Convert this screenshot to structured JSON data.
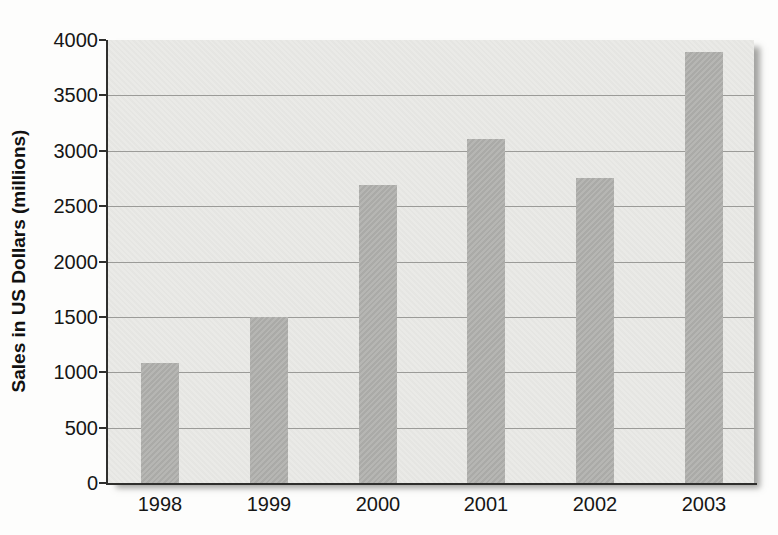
{
  "chart_data": {
    "type": "bar",
    "categories": [
      "1998",
      "1999",
      "2000",
      "2001",
      "2002",
      "2003"
    ],
    "values": [
      1080,
      1500,
      2690,
      3110,
      2750,
      3890
    ],
    "title": "",
    "xlabel": "",
    "ylabel": "Sales in US Dollars (millions)",
    "ylim": [
      0,
      4000
    ],
    "ytick_step": 500,
    "yticks": [
      0,
      500,
      1000,
      1500,
      2000,
      2500,
      3000,
      3500,
      4000
    ],
    "grid": "horizontal-major",
    "legend": "none",
    "colors": {
      "bar_fill": "#b2b2af",
      "plot_background": "#e9e9e6",
      "gridline": "#9b9b98",
      "axis_line": "#2f2f2d",
      "tick_label": "#161616",
      "page_background": "#fdfdfc"
    }
  }
}
